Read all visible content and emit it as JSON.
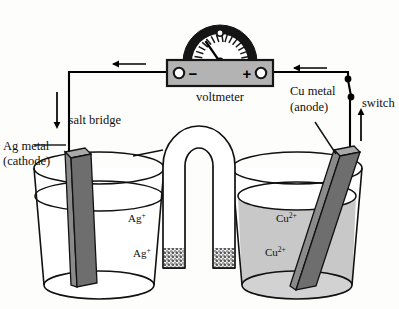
{
  "figure": {
    "background": "#fdfdfb"
  },
  "colors": {
    "outline": "#111111",
    "electrode_face": "#8a8a8a",
    "electrode_side": "#6e6e6e",
    "electrode_top": "#a9a9a9",
    "meter_body": "#b3b3b3",
    "meter_arc": "#151515",
    "solution_shaded": "#c8c8c8",
    "solution_clear": "#ffffff",
    "wire": "#000000"
  },
  "labels": {
    "voltmeter": "voltmeter",
    "salt_bridge": "salt bridge",
    "switch": "switch",
    "left_electrode_line1": "Ag metal",
    "left_electrode_line2": "(cathode)",
    "right_electrode_line1": "Cu metal",
    "right_electrode_line2": "(anode)"
  },
  "meter": {
    "minus_sign": "−",
    "plus_sign": "+",
    "needle_reading_fraction": 0.42
  },
  "left_beaker": {
    "solution_type": "clear",
    "ion_labels": [
      {
        "base": "Ag",
        "sup": "+",
        "x": 128,
        "y": 222
      },
      {
        "base": "Ag",
        "sup": "+",
        "x": 133,
        "y": 257
      }
    ]
  },
  "right_beaker": {
    "solution_type": "shaded",
    "ion_labels": [
      {
        "base": "Cu",
        "sup": "2+",
        "x": 276,
        "y": 222
      },
      {
        "base": "Cu",
        "sup": "2+",
        "x": 265,
        "y": 256
      }
    ]
  },
  "flow_arrows": [
    {
      "name": "electron-flow-top-left",
      "direction": "left"
    },
    {
      "name": "electron-flow-top-right",
      "direction": "left"
    },
    {
      "name": "electron-flow-down-left",
      "direction": "down"
    },
    {
      "name": "electron-flow-up-right",
      "direction": "up"
    }
  ]
}
